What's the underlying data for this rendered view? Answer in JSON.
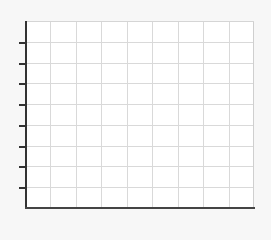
{
  "chart_data": {
    "type": "line",
    "title": "",
    "xlabel": "",
    "ylabel": "",
    "series": [],
    "x_gridlines": 9,
    "y_gridlines": 8,
    "y_ticks": 8,
    "tick_labels": [],
    "grid": true,
    "legend": null,
    "colors": {
      "background": "#f7f7f7",
      "plot_area": "#ffffff",
      "grid": "#d9d9d9",
      "axis": "#333333"
    }
  }
}
